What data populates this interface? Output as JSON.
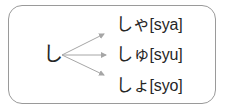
{
  "diagram": {
    "type": "kana-combination-chart",
    "source": {
      "kana": "し",
      "label": "shi"
    },
    "arrows": [
      {
        "name": "arrow-to-sya",
        "from": [
          62,
          55
        ],
        "to": [
          107,
          33
        ]
      },
      {
        "name": "arrow-to-syu",
        "from": [
          62,
          55
        ],
        "to": [
          110,
          55
        ]
      },
      {
        "name": "arrow-to-syo",
        "from": [
          62,
          55
        ],
        "to": [
          107,
          76
        ]
      }
    ],
    "results": [
      {
        "kana": "しゃ",
        "romaji": "[sya]",
        "full": "しゃ[sya]"
      },
      {
        "kana": "しゅ",
        "romaji": "[syu]",
        "full": "しゅ[syu]"
      },
      {
        "kana": "しょ",
        "romaji": "[syo]",
        "full": "しょ[syo]"
      }
    ],
    "colors": {
      "border": "#9a9a9a",
      "text": "#262626",
      "arrow": "#a6a6a6",
      "background": "#ffffff"
    }
  }
}
